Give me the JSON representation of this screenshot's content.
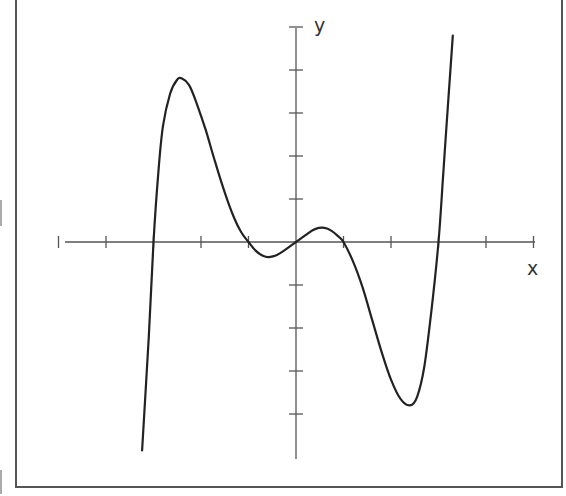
{
  "chart_data": {
    "type": "line",
    "title": "",
    "xlabel": "x",
    "ylabel": "y",
    "grid": false,
    "legend": null,
    "x_ticks": [
      -5,
      -4,
      -3,
      -2,
      -1,
      0,
      1,
      2,
      3,
      4,
      5
    ],
    "y_ticks": [
      -5,
      -4,
      -3,
      -2,
      -1,
      0,
      1,
      2,
      3,
      4,
      5
    ],
    "xlim": [
      -5,
      5
    ],
    "ylim": [
      -5,
      5
    ],
    "tick_labels_shown": false,
    "series": [
      {
        "name": "f(x)",
        "description": "odd quintic-like curve with zeros at x = -3, -1, 0, 1, 3",
        "zeros": [
          -3,
          -1,
          0,
          1,
          3
        ],
        "local_extrema": [
          {
            "x": -2.4,
            "y": 3.8,
            "kind": "max"
          },
          {
            "x": -0.57,
            "y": -0.35,
            "kind": "min"
          },
          {
            "x": 0.6,
            "y": 0.33,
            "kind": "max"
          },
          {
            "x": 2.4,
            "y": -3.8,
            "kind": "min"
          }
        ],
        "points": [
          [
            -3.24,
            -4.85
          ],
          [
            -3.1,
            -2.2
          ],
          [
            -3.0,
            0.0
          ],
          [
            -2.9,
            1.6
          ],
          [
            -2.8,
            2.7
          ],
          [
            -2.65,
            3.45
          ],
          [
            -2.5,
            3.78
          ],
          [
            -2.4,
            3.8
          ],
          [
            -2.25,
            3.65
          ],
          [
            -2.1,
            3.25
          ],
          [
            -1.9,
            2.6
          ],
          [
            -1.7,
            1.85
          ],
          [
            -1.5,
            1.15
          ],
          [
            -1.3,
            0.55
          ],
          [
            -1.15,
            0.22
          ],
          [
            -1.0,
            0.0
          ],
          [
            -0.85,
            -0.2
          ],
          [
            -0.7,
            -0.32
          ],
          [
            -0.57,
            -0.35
          ],
          [
            -0.4,
            -0.3
          ],
          [
            -0.2,
            -0.16
          ],
          [
            0.0,
            0.0
          ],
          [
            0.2,
            0.16
          ],
          [
            0.4,
            0.3
          ],
          [
            0.6,
            0.33
          ],
          [
            0.75,
            0.26
          ],
          [
            0.9,
            0.12
          ],
          [
            1.0,
            0.0
          ],
          [
            1.2,
            -0.45
          ],
          [
            1.4,
            -1.05
          ],
          [
            1.6,
            -1.8
          ],
          [
            1.8,
            -2.55
          ],
          [
            2.0,
            -3.2
          ],
          [
            2.2,
            -3.65
          ],
          [
            2.4,
            -3.8
          ],
          [
            2.55,
            -3.6
          ],
          [
            2.7,
            -2.9
          ],
          [
            2.85,
            -1.6
          ],
          [
            3.0,
            0.0
          ],
          [
            3.1,
            1.6
          ],
          [
            3.2,
            3.2
          ],
          [
            3.3,
            4.8
          ]
        ]
      }
    ]
  },
  "labels": {
    "x_axis": "x",
    "y_axis": "y"
  },
  "layout": {
    "origin_px": [
      296,
      242
    ],
    "x_unit_px": 47.5,
    "y_unit_px": 43,
    "x_axis_px": [
      65,
      535
    ],
    "y_axis_px": [
      28,
      459
    ],
    "colors": {
      "axis": "#555555",
      "curve": "#222222",
      "frame": "#555555",
      "background": "#ffffff"
    }
  }
}
